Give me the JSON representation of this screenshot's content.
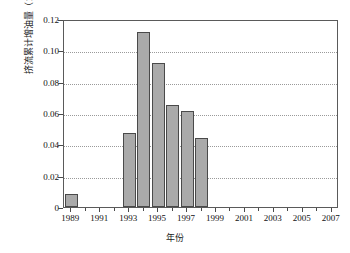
{
  "chart_data": {
    "type": "bar",
    "title": "",
    "xlabel": "年份",
    "ylabel": "挤流累计增油量（10⁴t）",
    "categories": [
      1989,
      1990,
      1991,
      1992,
      1993,
      1994,
      1995,
      1996,
      1997,
      1998,
      1999,
      2000,
      2001,
      2002,
      2003,
      2004,
      2005,
      2006,
      2007
    ],
    "values": [
      0.008,
      0,
      0,
      0,
      0.047,
      0.112,
      0.092,
      0.065,
      0.061,
      0.044,
      0,
      0,
      0,
      0,
      0,
      0,
      0,
      0,
      0
    ],
    "series": [
      {
        "name": "挤流累计增油量",
        "values": [
          0.008,
          0,
          0,
          0,
          0.047,
          0.112,
          0.092,
          0.065,
          0.061,
          0.044,
          0,
          0,
          0,
          0,
          0,
          0,
          0,
          0,
          0
        ]
      }
    ],
    "xlim": [
      1988.5,
      2007.5
    ],
    "ylim": [
      0,
      0.12
    ],
    "ytick_values": [
      0,
      0.02,
      0.04,
      0.06,
      0.08,
      0.1,
      0.12
    ],
    "ytick_labels": [
      "0",
      "0.02",
      "0.04",
      "0.06",
      "0.08",
      "0.10",
      "0.12"
    ],
    "xtick_values": [
      1989,
      1991,
      1993,
      1995,
      1997,
      1999,
      2001,
      2003,
      2005,
      2007
    ],
    "xtick_labels": [
      "1989",
      "1991",
      "1993",
      "1995",
      "1997",
      "1999",
      "2001",
      "2003",
      "2005",
      "2007"
    ],
    "xtick_minor_values": [
      1990,
      1992,
      1994,
      1996,
      1998,
      2000,
      2002,
      2004,
      2006
    ],
    "grid": "horizontal-dotted",
    "legend": "none",
    "bar_fill_color": "#aaaaaa",
    "bar_edge_color": "#4a4a4a",
    "grid_color": "#9a9a9a",
    "axis_color": "#5a5a5a",
    "background_color": "#ffffff"
  }
}
